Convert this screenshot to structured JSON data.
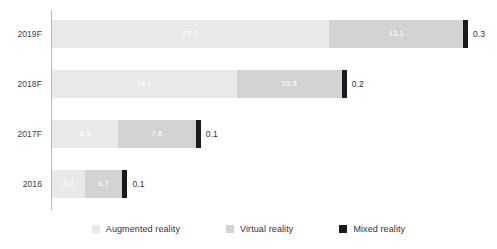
{
  "chart_data": {
    "type": "bar",
    "orientation": "horizontal",
    "stacked": true,
    "title": "",
    "subtitle": "",
    "xlabel": "",
    "ylabel": "",
    "grid": false,
    "legend_position": "bottom",
    "categories": [
      "2019F",
      "2018F",
      "2017F",
      "2016"
    ],
    "series": [
      {
        "name": "Augmented reality",
        "color": "#e9e9e9",
        "values": [
          27.2,
          18.1,
          6.5,
          3.2
        ]
      },
      {
        "name": "Virtual reality",
        "color": "#d3d3d4",
        "values": [
          13.1,
          10.3,
          7.6,
          3.7
        ]
      },
      {
        "name": "Mixed reality",
        "color": "#1b1b1f",
        "values": [
          0.3,
          0.2,
          0.1,
          0.1
        ]
      }
    ],
    "totals": [
      40.6,
      28.6,
      14.2,
      7.0
    ],
    "xlim": [
      0,
      40.6
    ],
    "px_per_unit": 10.2,
    "rows": [
      {
        "category": "2019F",
        "segments": [
          {
            "series": "Augmented reality",
            "value": 27.2,
            "label": "27.2",
            "label_inside": true
          },
          {
            "series": "Virtual reality",
            "value": 13.1,
            "label": "13.1",
            "label_inside": true
          },
          {
            "series": "Mixed reality",
            "value": 0.3,
            "label": "0.3",
            "label_inside": false
          }
        ]
      },
      {
        "category": "2018F",
        "segments": [
          {
            "series": "Augmented reality",
            "value": 18.1,
            "label": "18.1",
            "label_inside": true
          },
          {
            "series": "Virtual reality",
            "value": 10.3,
            "label": "10.3",
            "label_inside": true
          },
          {
            "series": "Mixed reality",
            "value": 0.2,
            "label": "0.2",
            "label_inside": false
          }
        ]
      },
      {
        "category": "2017F",
        "segments": [
          {
            "series": "Augmented reality",
            "value": 6.5,
            "label": "6.5",
            "label_inside": true
          },
          {
            "series": "Virtual reality",
            "value": 7.6,
            "label": "7.6",
            "label_inside": true
          },
          {
            "series": "Mixed reality",
            "value": 0.1,
            "label": "0.1",
            "label_inside": false
          }
        ]
      },
      {
        "category": "2016",
        "segments": [
          {
            "series": "Augmented reality",
            "value": 3.2,
            "label": "3.2",
            "label_inside": true
          },
          {
            "series": "Virtual reality",
            "value": 3.7,
            "label": "3.7",
            "label_inside": true
          },
          {
            "series": "Mixed reality",
            "value": 0.1,
            "label": "0.1",
            "label_inside": false
          }
        ]
      }
    ]
  },
  "axis": {
    "tick_labels": [
      "2019F",
      "2018F",
      "2017F",
      "2016"
    ],
    "line_color": "#b9b9bd"
  },
  "legend": {
    "items": [
      {
        "label": "Augmented reality",
        "color": "#e9e9e9",
        "swatch_class": "sw-aug"
      },
      {
        "label": "Virtual reality",
        "color": "#d3d3d4",
        "swatch_class": "sw-vir"
      },
      {
        "label": "Mixed reality",
        "color": "#1b1b1f",
        "swatch_class": "sw-mix"
      }
    ]
  },
  "theme": {
    "background": "#ffffff",
    "label_color": "#3d3d3f",
    "inside_label_color": "#ffffff",
    "outside_label_color": "#2f2f31"
  }
}
